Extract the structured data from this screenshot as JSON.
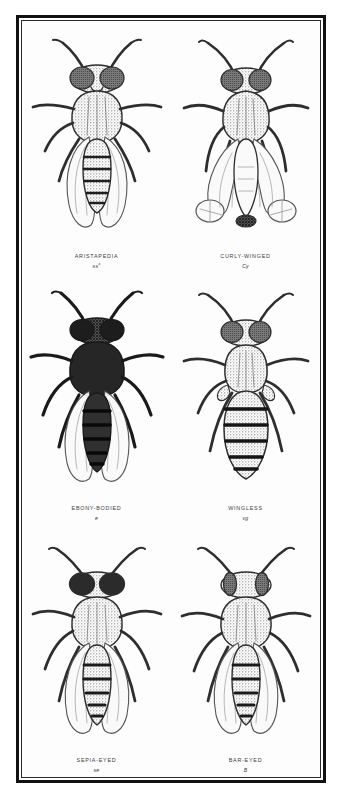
{
  "plate": {
    "title": "Drosophila mutant forms plate",
    "border_color": "#111111",
    "background_color": "#fdfdfd",
    "ink_color": "#3c3c3c"
  },
  "specimens": [
    {
      "name": "ARISTAPEDIA",
      "symbol": "ss",
      "symbol_sup": "a",
      "row": 1,
      "column": "left",
      "body_tone": "#8e8e8e",
      "wings": "normal",
      "notes": "normal winged fly with leg-like aristae"
    },
    {
      "name": "CURLY-WINGED",
      "symbol": "Cy",
      "symbol_sup": "",
      "row": 1,
      "column": "right",
      "body_tone": "#9a9a9a",
      "wings": "curled",
      "notes": "wings curled upward and outward"
    },
    {
      "name": "EBONY-BODIED",
      "symbol": "e",
      "symbol_sup": "",
      "row": 2,
      "column": "left",
      "body_tone": "#2b2b2b",
      "wings": "normal",
      "notes": "very dark, nearly black body"
    },
    {
      "name": "WINGLESS",
      "symbol": "vg",
      "symbol_sup": "",
      "row": 2,
      "column": "right",
      "body_tone": "#8a8a8a",
      "wings": "absent",
      "notes": "vestigial, wings absent, banded abdomen"
    },
    {
      "name": "SEPIA-EYED",
      "symbol": "se",
      "symbol_sup": "",
      "row": 3,
      "column": "left",
      "body_tone": "#8e8e8e",
      "wings": "normal",
      "notes": "dark sepia coloured eyes"
    },
    {
      "name": "BAR-EYED",
      "symbol": "B",
      "symbol_sup": "",
      "row": 3,
      "column": "right",
      "body_tone": "#8e8e8e",
      "wings": "normal",
      "notes": "narrow bar shaped eyes"
    }
  ]
}
